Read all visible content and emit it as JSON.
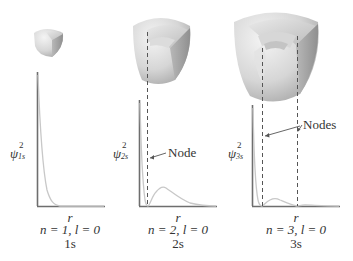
{
  "figure": {
    "panels": [
      {
        "id": "1s",
        "y_label_symbol": "ψ",
        "y_label_subscript": "1s",
        "y_label_superscript": "2",
        "x_label": "r",
        "quantum_numbers": "n = 1, l = 0",
        "orbital_name": "1s",
        "node_label": "",
        "node_count": 0
      },
      {
        "id": "2s",
        "y_label_symbol": "ψ",
        "y_label_subscript": "2s",
        "y_label_superscript": "2",
        "x_label": "r",
        "quantum_numbers": "n = 2, l = 0",
        "orbital_name": "2s",
        "node_label": "Node",
        "node_count": 1
      },
      {
        "id": "3s",
        "y_label_symbol": "ψ",
        "y_label_subscript": "3s",
        "y_label_superscript": "2",
        "x_label": "r",
        "quantum_numbers": "n = 3, l = 0",
        "orbital_name": "3s",
        "node_label": "Nodes",
        "node_count": 2
      }
    ],
    "colors": {
      "axis": "#6e6e6e",
      "curve": "#c8c8c8",
      "dashed": "#555555",
      "sphere_light": "#ededed",
      "sphere_mid": "#cfcfcf",
      "sphere_dark": "#a9a9a9",
      "text": "#333333"
    }
  }
}
